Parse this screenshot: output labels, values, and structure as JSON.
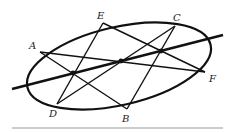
{
  "diagram": {
    "colors": {
      "stroke": "#111111",
      "background": "#ffffff",
      "rule": "#999999"
    },
    "ellipse": {
      "cx": 119,
      "cy": 66,
      "rx": 94,
      "ry": 39,
      "rotate": -13
    },
    "points": [
      {
        "id": "A",
        "label": "A",
        "x": 40,
        "y": 52,
        "lx": 29,
        "ly": 49
      },
      {
        "id": "E",
        "label": "E",
        "x": 103,
        "y": 23,
        "lx": 97,
        "ly": 19
      },
      {
        "id": "C",
        "label": "C",
        "x": 175,
        "y": 26,
        "lx": 173,
        "ly": 21
      },
      {
        "id": "F",
        "label": "F",
        "x": 205,
        "y": 72,
        "lx": 209,
        "ly": 82
      },
      {
        "id": "B",
        "label": "B",
        "x": 127,
        "y": 109,
        "lx": 122,
        "ly": 122
      },
      {
        "id": "D",
        "label": "D",
        "x": 57,
        "y": 104,
        "lx": 49,
        "ly": 117
      }
    ],
    "segments": [
      {
        "from": "A",
        "to": "B"
      },
      {
        "from": "B",
        "to": "C"
      },
      {
        "from": "C",
        "to": "D"
      },
      {
        "from": "D",
        "to": "E"
      },
      {
        "from": "E",
        "to": "F"
      },
      {
        "from": "F",
        "to": "A"
      }
    ],
    "pascal_line": {
      "x1": 12,
      "y1": 89,
      "x2": 223,
      "y2": 35
    },
    "intersections": [
      {
        "name": "AB-DE",
        "x": 73,
        "y": 73
      },
      {
        "name": "AF-CD",
        "x": 121,
        "y": 61
      },
      {
        "name": "BC-EF",
        "x": 161,
        "y": 51
      }
    ],
    "rule": {
      "x1": 12,
      "y1": 128,
      "x2": 223,
      "y2": 128
    }
  }
}
